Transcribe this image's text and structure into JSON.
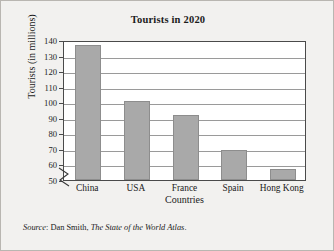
{
  "chart_data": {
    "type": "bar",
    "title": "Tourists in 2020",
    "xlabel": "Countries",
    "ylabel": "Tourists (in millions)",
    "categories": [
      "China",
      "USA",
      "France",
      "Spain",
      "Hong Kong"
    ],
    "values": [
      137,
      101,
      92,
      69,
      57
    ],
    "yticks": [
      50,
      60,
      70,
      80,
      90,
      100,
      110,
      120,
      130,
      140
    ],
    "ylim": [
      50,
      140
    ],
    "grid": true,
    "axis_break": true,
    "legend": "none",
    "bar_color": "#a9a9a9",
    "bar_edge_color": "#8d8d8d",
    "plot_background": "#ffffff",
    "figure_background": "#f2f1ef",
    "frame_color": "#4a4a4a",
    "gridline_color": "#9a9a9a",
    "text_color": "#1b1b1b"
  },
  "source": {
    "label": "Source",
    "separator": ": ",
    "author": "Dan Smith, ",
    "work": "The State of the World Atlas",
    "terminator": "."
  }
}
